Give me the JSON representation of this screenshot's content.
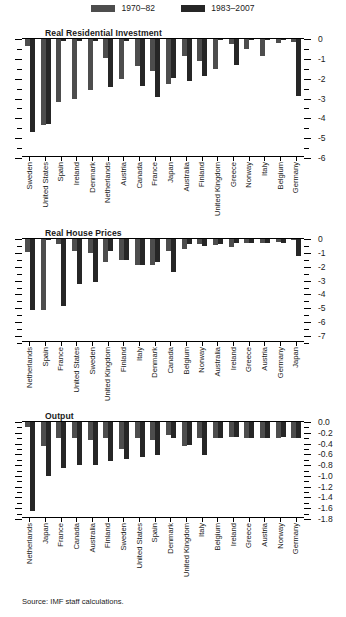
{
  "legend": {
    "items": [
      {
        "label": "1970–82",
        "color": "#4d4d4d"
      },
      {
        "label": "1983–2007",
        "color": "#262626"
      }
    ]
  },
  "source": {
    "text": "Source: IMF staff calculations."
  },
  "colors": {
    "series1": "#4d4d4d",
    "series2": "#262626",
    "axis": "#000000",
    "background": "#ffffff"
  },
  "chart_data": [
    {
      "type": "bar",
      "title": "Real Residential Investment",
      "xlabel": "",
      "ylabel": "",
      "ylim": [
        -6,
        0
      ],
      "yticks": [
        0,
        -1,
        -2,
        -3,
        -4,
        -5,
        -6
      ],
      "ytick_labels": [
        "0",
        "-1",
        "-2",
        "-3",
        "-4",
        "-5",
        "-6"
      ],
      "minor_ticks": true,
      "grid": false,
      "legend_position": "top",
      "categories": [
        "Sweden",
        "United States",
        "Spain",
        "Ireland",
        "Denmark",
        "Netherlands",
        "Austria",
        "Canada",
        "France",
        "Japan",
        "Australia",
        "Finland",
        "United Kingdom",
        "Greece",
        "Norway",
        "Italy",
        "Belgium",
        "Germany"
      ],
      "series": [
        {
          "name": "1970–82",
          "values": [
            -0.35,
            -4.35,
            -3.2,
            -3.0,
            -2.55,
            -0.95,
            -2.0,
            -1.35,
            -1.6,
            -2.25,
            -0.85,
            -1.1,
            -1.5,
            -0.25,
            -0.5,
            -0.85,
            -0.2,
            -0.15
          ]
        },
        {
          "name": "1983–2007",
          "values": [
            -4.7,
            -4.3,
            -0.1,
            -0.1,
            -0.1,
            -2.4,
            -0.1,
            -2.35,
            -2.9,
            -1.95,
            -2.1,
            -1.85,
            -0.05,
            -1.3,
            -0.05,
            -0.05,
            -0.05,
            -2.85
          ]
        }
      ]
    },
    {
      "type": "bar",
      "title": "Real House Prices",
      "xlabel": "",
      "ylabel": "",
      "ylim": [
        -7.5,
        0
      ],
      "yticks": [
        0,
        -1,
        -2,
        -3,
        -4,
        -5,
        -6,
        -7
      ],
      "ytick_labels": [
        "0",
        "-1",
        "-2",
        "-3",
        "-4",
        "-5",
        "-6",
        "-7"
      ],
      "minor_ticks": true,
      "grid": false,
      "legend_position": "top",
      "categories": [
        "Netherlands",
        "Spain",
        "France",
        "United States",
        "Sweden",
        "United Kingdom",
        "Finland",
        "Italy",
        "Denmark",
        "Canada",
        "Belgium",
        "Norway",
        "Australia",
        "Ireland",
        "Greece",
        "Austria",
        "Germany",
        "Japan"
      ],
      "series": [
        {
          "name": "1970–82",
          "values": [
            -0.95,
            -5.1,
            -0.35,
            -0.9,
            -1.0,
            -1.65,
            -1.5,
            -1.85,
            -1.85,
            -0.85,
            -0.7,
            -0.35,
            -0.4,
            -0.55,
            -0.3,
            -0.3,
            -0.25,
            -0.05
          ]
        },
        {
          "name": "1983–2007",
          "values": [
            -5.15,
            -0.1,
            -4.8,
            -3.25,
            -3.1,
            -0.9,
            -1.5,
            -1.9,
            -1.65,
            -2.35,
            -0.35,
            -0.5,
            -0.35,
            -0.3,
            -0.3,
            -0.3,
            -0.3,
            -1.25
          ]
        }
      ]
    },
    {
      "type": "bar",
      "title": "Output",
      "xlabel": "",
      "ylabel": "",
      "ylim": [
        -1.8,
        0.0
      ],
      "yticks": [
        0.0,
        -0.2,
        -0.4,
        -0.6,
        -0.8,
        -1.0,
        -1.2,
        -1.4,
        -1.6,
        -1.8
      ],
      "ytick_labels": [
        "0.0",
        "-0.2",
        "-0.4",
        "-0.6",
        "-0.8",
        "-1.0",
        "-1.2",
        "-1.4",
        "-1.6",
        "-1.8"
      ],
      "minor_ticks": true,
      "grid": false,
      "legend_position": "top",
      "categories": [
        "Netherlands",
        "Japan",
        "France",
        "Canada",
        "Australia",
        "Finland",
        "Sweden",
        "United States",
        "Spain",
        "Denmark",
        "United Kingdom",
        "Italy",
        "Belgium",
        "Ireland",
        "Greece",
        "Austria",
        "Norway",
        "Germany"
      ],
      "series": [
        {
          "name": "1970–82",
          "values": [
            -0.1,
            -0.45,
            -0.3,
            -0.3,
            -0.33,
            -0.3,
            -0.5,
            -0.3,
            -0.33,
            -0.25,
            -0.45,
            -0.3,
            -0.3,
            -0.28,
            -0.3,
            -0.3,
            -0.3,
            -0.3
          ]
        },
        {
          "name": "1983–2007",
          "values": [
            -1.65,
            -1.0,
            -0.85,
            -0.8,
            -0.8,
            -0.72,
            -0.68,
            -0.65,
            -0.62,
            -0.3,
            -0.43,
            -0.62,
            -0.3,
            -0.27,
            -0.3,
            -0.3,
            -0.27,
            -0.3
          ]
        }
      ]
    }
  ]
}
